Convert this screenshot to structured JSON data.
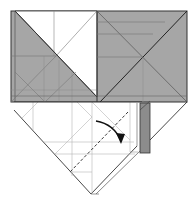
{
  "diagram": {
    "type": "origami-fold-step",
    "canvas": {
      "width": 194,
      "height": 199,
      "background": "#ffffff"
    },
    "colors": {
      "gray_fill": "#a6a6a6",
      "gray_fill_dark": "#8c8c8c",
      "white_fill": "#ffffff",
      "edge": "#333333",
      "crease": "#7a7a7a",
      "crease_light": "#b5b5b5",
      "dashed_fold": "#222222",
      "arrow": "#111111"
    },
    "regions": {
      "top_panel": {
        "x": 11,
        "y": 11,
        "w": 176,
        "h": 91
      },
      "left_white_triangle": "15,11 97,11 97,97",
      "upper_white_strip": "54,11 97,11 97,55",
      "bottom_diamond": "14,102 142,102 142,128 91,194 14,117",
      "right_flap_gray": "141,103 150,103 150,153 141,153"
    },
    "fold_instruction": {
      "dashed_line": {
        "x1": 128,
        "y1": 112,
        "x2": 70,
        "y2": 172
      },
      "arrow_path": "M96 121 Q114 124 121 141",
      "arrow_head": "121,141 117,133 124,134"
    }
  }
}
